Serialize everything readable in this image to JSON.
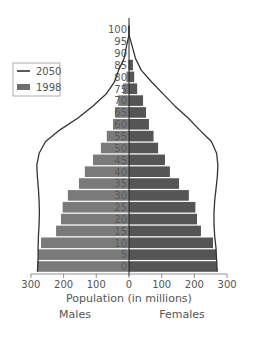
{
  "chart_data": {
    "type": "bar",
    "subtype": "population-pyramid",
    "title": "",
    "xlabel": "Population (in millions)",
    "ylabel": "",
    "side_labels": {
      "left": "Males",
      "right": "Females"
    },
    "xlim": [
      -300,
      300
    ],
    "x_ticks": [
      300,
      200,
      100,
      0,
      100,
      200,
      300
    ],
    "grid": false,
    "legend": {
      "position": "left",
      "entries": [
        {
          "label": "2050",
          "style": "line",
          "color": "#333333"
        },
        {
          "label": "1998",
          "style": "bar",
          "color": "#6e6e6e"
        }
      ]
    },
    "categories": [
      "0",
      "5",
      "10",
      "15",
      "20",
      "25",
      "30",
      "35",
      "40",
      "45",
      "50",
      "55",
      "60",
      "65",
      "70",
      "75",
      "80",
      "85",
      "90",
      "95",
      "100"
    ],
    "series": [
      {
        "name": "1998 Males",
        "year": "1998",
        "side": "left",
        "color": "#7a7a7a",
        "values": [
          281,
          278,
          269,
          223,
          208,
          203,
          187,
          153,
          135,
          110,
          86,
          68,
          49,
          43,
          33,
          18,
          8,
          2,
          0,
          0,
          0
        ]
      },
      {
        "name": "1998 Females",
        "year": "1998",
        "side": "right",
        "color": "#555555",
        "values": [
          269,
          266,
          257,
          220,
          208,
          203,
          183,
          153,
          125,
          110,
          89,
          75,
          61,
          52,
          43,
          25,
          16,
          12,
          0,
          0,
          0
        ]
      },
      {
        "name": "2050 Males",
        "year": "2050",
        "side": "left",
        "style": "line",
        "values": [
          280,
          278,
          278,
          277,
          275,
          274,
          275,
          277,
          280,
          282,
          275,
          255,
          210,
          155,
          110,
          70,
          45,
          32,
          15,
          8,
          0
        ]
      },
      {
        "name": "2050 Females",
        "year": "2050",
        "side": "right",
        "style": "line",
        "values": [
          270,
          268,
          266,
          262,
          260,
          260,
          262,
          266,
          270,
          272,
          268,
          252,
          215,
          180,
          140,
          105,
          70,
          38,
          20,
          10,
          0
        ]
      }
    ]
  }
}
